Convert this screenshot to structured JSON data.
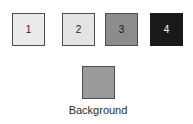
{
  "legend": {
    "class_swatches": [
      {
        "name": "class-swatch-1",
        "label": "1",
        "fill": "#ebebeb",
        "border": "#4d4d4d",
        "text_color": "#262626",
        "x": 12,
        "y": 13,
        "size": 33
      },
      {
        "name": "class-swatch-2",
        "label": "2",
        "fill": "#e4e4e4",
        "border": "#4d4d4d",
        "text_color": "#262626",
        "x": 62,
        "y": 13,
        "size": 33
      },
      {
        "name": "class-swatch-3",
        "label": "3",
        "fill": "#8c8c8c",
        "border": "#4d4d4d",
        "text_color": "#1a1a1a",
        "x": 105,
        "y": 13,
        "size": 33
      },
      {
        "name": "class-swatch-4",
        "label": "4",
        "fill": "#1a1a1a",
        "border": "#1a1a1a",
        "text_color": "#ffffff",
        "x": 150,
        "y": 13,
        "size": 33
      }
    ],
    "background_swatch": {
      "name": "background-swatch",
      "label": "",
      "caption": "Background",
      "fill": "#9a9a9a",
      "border": "#4d4d4d",
      "x": 82,
      "y": 66,
      "size": 33,
      "caption_color": "#2b2b2b",
      "caption_x": 58,
      "caption_y": 105,
      "caption_width": 80
    }
  }
}
